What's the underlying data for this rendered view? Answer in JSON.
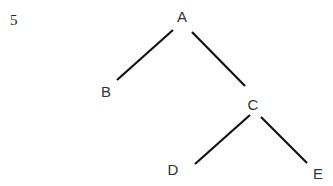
{
  "question_number": "5",
  "tree": {
    "nodes": [
      {
        "id": "A",
        "label": "A",
        "x": 182,
        "y": 22
      },
      {
        "id": "B",
        "label": "B",
        "x": 106,
        "y": 97
      },
      {
        "id": "C",
        "label": "C",
        "x": 253,
        "y": 110
      },
      {
        "id": "D",
        "label": "D",
        "x": 173,
        "y": 175
      },
      {
        "id": "E",
        "label": "E",
        "x": 318,
        "y": 179
      }
    ],
    "edges": [
      {
        "from": "A",
        "to": "B",
        "x1": 173,
        "y1": 30,
        "x2": 117,
        "y2": 80
      },
      {
        "from": "A",
        "to": "C",
        "x1": 192,
        "y1": 32,
        "x2": 245,
        "y2": 86
      },
      {
        "from": "C",
        "to": "D",
        "x1": 250,
        "y1": 115,
        "x2": 195,
        "y2": 164
      },
      {
        "from": "C",
        "to": "E",
        "x1": 261,
        "y1": 117,
        "x2": 307,
        "y2": 163
      }
    ]
  }
}
